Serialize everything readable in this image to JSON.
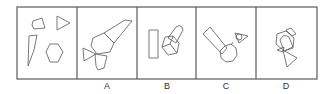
{
  "puzzle": {
    "cells": [
      {
        "id": "question",
        "label": ""
      },
      {
        "id": "A",
        "label": "A"
      },
      {
        "id": "B",
        "label": "B"
      },
      {
        "id": "C",
        "label": "C"
      },
      {
        "id": "D",
        "label": "D"
      }
    ],
    "question_shapes": [
      "quadrilateral",
      "triangle",
      "long-quadrilateral",
      "hexagon"
    ],
    "colors": {
      "frame": "#5a5a5a",
      "shape_stroke": "#6a6a6a",
      "label": "#333333",
      "background": "#ffffff"
    }
  }
}
